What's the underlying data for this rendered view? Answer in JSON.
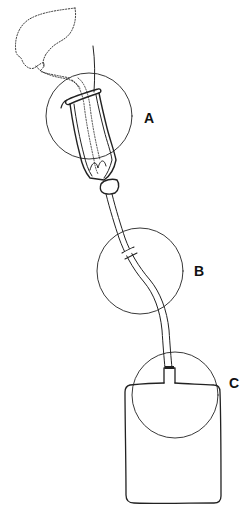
{
  "figure": {
    "stroke_color": "#222222",
    "background": "#ffffff",
    "labels": [
      {
        "id": "A",
        "text": "A",
        "target": "Sheath / condom catheter attachment"
      },
      {
        "id": "B",
        "text": "B",
        "target": "Drainage tubing junction"
      },
      {
        "id": "C",
        "text": "C",
        "target": "Tubing-to-bag connection"
      }
    ],
    "components": [
      {
        "name": "body-outline",
        "style": "dotted"
      },
      {
        "name": "condom-sheath",
        "style": "solid"
      },
      {
        "name": "drainage-tube",
        "style": "solid"
      },
      {
        "name": "collection-bag",
        "style": "solid"
      }
    ]
  }
}
